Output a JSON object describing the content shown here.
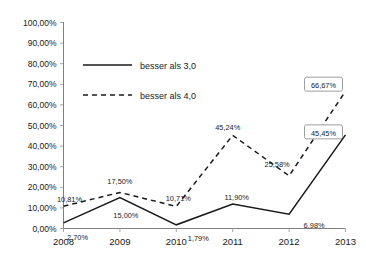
{
  "chart_data": {
    "type": "line",
    "title": "",
    "xlabel": "",
    "ylabel": "",
    "categories": [
      "2008",
      "2009",
      "2010",
      "2011",
      "2012",
      "2013"
    ],
    "ylim": [
      0,
      100
    ],
    "ytick_values": [
      0,
      10,
      20,
      30,
      40,
      50,
      60,
      70,
      80,
      90,
      100
    ],
    "ytick_labels": [
      "0,00%",
      "10,00%",
      "20,00%",
      "30,00%",
      "40,00%",
      "50,00%",
      "60,00%",
      "70,00%",
      "80,00%",
      "90,00%",
      "100,00%"
    ],
    "grid": false,
    "legend_position": "inside-upper-left",
    "series": [
      {
        "name": "besser als 3,0",
        "style": "solid",
        "color": "#1a1a1a",
        "values": [
          2.7,
          15.0,
          1.79,
          11.9,
          6.98,
          45.45
        ],
        "labels": [
          "2,70%",
          "15,00%",
          "1,79%",
          "11,90%",
          "6,98%",
          "45,45%"
        ],
        "label_positions": [
          "below",
          "below",
          "below",
          "above",
          "below",
          "boxed"
        ]
      },
      {
        "name": "besser als 4,0",
        "style": "dashed",
        "color": "#1a1a1a",
        "values": [
          10.81,
          17.5,
          10.71,
          45.24,
          25.58,
          66.67
        ],
        "labels": [
          "10,81%",
          "17,50%",
          "10,71%",
          "45,24%",
          "25,58%",
          "66,67%"
        ],
        "label_positions": [
          "above",
          "above",
          "above",
          "above",
          "above-left",
          "boxed"
        ]
      }
    ]
  },
  "legend": {
    "items": [
      {
        "label": "besser als 3,0",
        "style": "solid"
      },
      {
        "label": "besser als 4,0",
        "style": "dashed"
      }
    ]
  },
  "callouts": [
    {
      "label": "66,67%",
      "series": "besser als 4,0",
      "year": "2013"
    },
    {
      "label": "45,45%",
      "series": "besser als 3,0",
      "year": "2013"
    }
  ]
}
